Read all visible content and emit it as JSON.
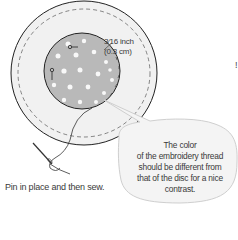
{
  "diagram": {
    "measurement_label": {
      "line1": "3⁄16 inch",
      "line2": "(0.3 cm)"
    },
    "caption": "Pin in place and then sew.",
    "callout": {
      "line1": "The color",
      "line2": "of the embroidery thread",
      "line3": "should be different from",
      "line4": "that of the disc for a nice",
      "line5": "contrast."
    },
    "edge_mark": "!",
    "colors": {
      "outer_disc": "#f1f1f1",
      "inner_disc": "#b9b9b9",
      "dots": "#ffffff",
      "outline": "#222222",
      "text": "#3a3a3a",
      "bubble_fill": "#f4f4f4"
    },
    "elements": [
      "outer-fabric-circle",
      "inner-disc",
      "dashed-seam",
      "pins",
      "needle-and-thread",
      "speech-bubble"
    ]
  }
}
